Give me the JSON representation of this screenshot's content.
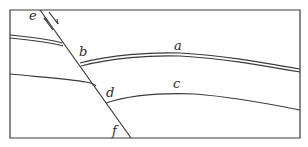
{
  "diagram": {
    "type": "geological fault cross-section",
    "labels": {
      "a": "a",
      "b": "b",
      "c": "c",
      "d": "d",
      "e": "e",
      "f": "f"
    },
    "elements": {
      "fault_line": "e–f",
      "bed_a": "double-line stratum offset at b",
      "bed_c": "single-line stratum offset at d",
      "arrows": "opposing slip arrows along fault near e"
    },
    "colors": {
      "line": "#3a3a3a",
      "background": "#ffffff"
    }
  }
}
